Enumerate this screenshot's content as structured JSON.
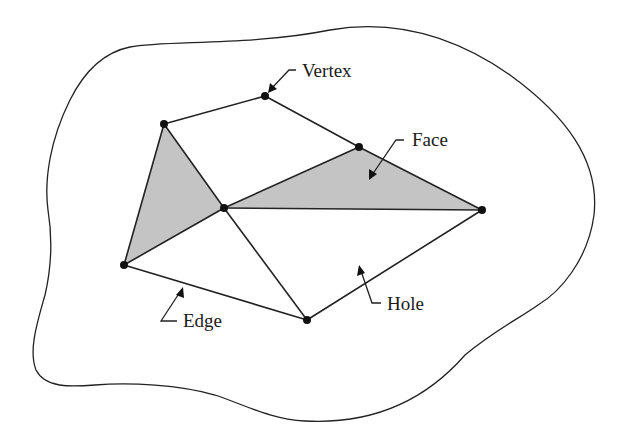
{
  "diagram": {
    "type": "planar-mesh-illustration",
    "colors": {
      "background": "#ffffff",
      "stroke": "#222222",
      "face_fill": "#c4c4c4",
      "vertex": "#111111"
    },
    "labels": {
      "vertex": "Vertex",
      "face": "Face",
      "hole": "Hole",
      "edge": "Edge"
    },
    "vertices": [
      {
        "id": "v1",
        "x": 164,
        "y": 124
      },
      {
        "id": "v2",
        "x": 265,
        "y": 96
      },
      {
        "id": "v3",
        "x": 359,
        "y": 147
      },
      {
        "id": "v4",
        "x": 482,
        "y": 210
      },
      {
        "id": "v5",
        "x": 224,
        "y": 208
      },
      {
        "id": "v6",
        "x": 124,
        "y": 265
      },
      {
        "id": "v7",
        "x": 307,
        "y": 320
      }
    ],
    "edges": [
      [
        "v1",
        "v2"
      ],
      [
        "v2",
        "v3"
      ],
      [
        "v3",
        "v4"
      ],
      [
        "v1",
        "v5"
      ],
      [
        "v1",
        "v6"
      ],
      [
        "v5",
        "v6"
      ],
      [
        "v5",
        "v3"
      ],
      [
        "v5",
        "v4"
      ],
      [
        "v5",
        "v7"
      ],
      [
        "v6",
        "v7"
      ],
      [
        "v7",
        "v4"
      ]
    ],
    "shaded_faces": [
      [
        "v1",
        "v5",
        "v6"
      ],
      [
        "v5",
        "v3",
        "v4"
      ]
    ]
  }
}
